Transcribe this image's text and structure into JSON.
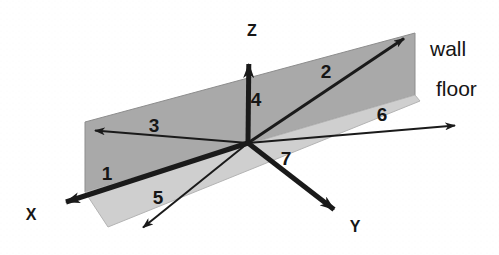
{
  "figure": {
    "background_color": "#fdfdfd",
    "line_color": "#1a1a1a",
    "wall_fill": "#a9a9a9",
    "floor_fill": "#cfcfcf"
  },
  "planes": [
    {
      "id": "wall",
      "label": "wall",
      "label_x": 430,
      "label_y": 56,
      "fill": "#a9a9a9",
      "points": "85,122 415,33 415,95 85,192"
    },
    {
      "id": "floor",
      "label": "floor",
      "label_x": 436,
      "label_y": 96,
      "fill": "#cfcfcf",
      "points": "85,192 415,95 420,101 108,227"
    }
  ],
  "axes": [
    {
      "id": "z",
      "label": "Z",
      "label_x": 252,
      "label_y": 36,
      "x1": 248,
      "y1": 143,
      "x2": 249,
      "y2": 52,
      "width": 5,
      "arrow": "filled"
    },
    {
      "id": "x",
      "label": "X",
      "label_x": 31,
      "label_y": 220,
      "x1": 248,
      "y1": 143,
      "x2": 54,
      "y2": 206,
      "width": 5,
      "arrow": "filled"
    },
    {
      "id": "y",
      "label": "Y",
      "label_x": 355,
      "label_y": 232,
      "x1": 248,
      "y1": 143,
      "x2": 345,
      "y2": 218,
      "width": 5,
      "arrow": "filled"
    }
  ],
  "vectors": [
    {
      "id": "vector-1",
      "label": "1",
      "label_x": 107,
      "label_y": 180,
      "x1": 248,
      "y1": 143,
      "x2": 54,
      "y2": 206,
      "width": 5,
      "description": "thick vector along negative X direction"
    },
    {
      "id": "vector-2",
      "label": "2",
      "label_x": 326,
      "label_y": 78,
      "x1": 248,
      "y1": 143,
      "x2": 412,
      "y2": 32,
      "width": 3,
      "description": "vector up-right along the wall plane"
    },
    {
      "id": "vector-3",
      "label": "3",
      "label_x": 154,
      "label_y": 132,
      "x1": 248,
      "y1": 143,
      "x2": 88,
      "y2": 130,
      "width": 2,
      "description": "vector left along the wall plane"
    },
    {
      "id": "vector-4",
      "label": "4",
      "label_x": 256,
      "label_y": 106,
      "x1": 248,
      "y1": 143,
      "x2": 249,
      "y2": 52,
      "width": 5,
      "description": "vertical vector coincident with the Z axis"
    },
    {
      "id": "vector-5",
      "label": "5",
      "label_x": 158,
      "label_y": 204,
      "x1": 248,
      "y1": 143,
      "x2": 137,
      "y2": 232,
      "width": 2,
      "description": "vector down-left across the floor plane"
    },
    {
      "id": "vector-6",
      "label": "6",
      "label_x": 382,
      "label_y": 121,
      "x1": 248,
      "y1": 143,
      "x2": 462,
      "y2": 125,
      "width": 2,
      "description": "vector right along the floor plane"
    },
    {
      "id": "vector-7",
      "label": "7",
      "label_x": 286,
      "label_y": 165,
      "x1": 248,
      "y1": 143,
      "x2": 345,
      "y2": 218,
      "width": 5,
      "description": "thick vector coincident with the Y axis"
    }
  ],
  "origin": {
    "x": 248,
    "y": 143
  }
}
